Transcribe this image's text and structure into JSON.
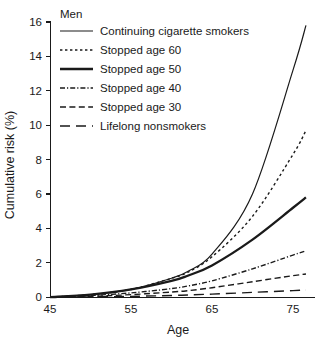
{
  "chart_data": {
    "type": "line",
    "title": "Men",
    "xlabel": "Age",
    "ylabel": "Cumulative risk (%)",
    "xlim": [
      45,
      77
    ],
    "ylim": [
      0,
      16.4
    ],
    "xticks": [
      45,
      55,
      65,
      75
    ],
    "yticks": [
      0,
      2,
      4,
      6,
      8,
      10,
      12,
      14,
      16
    ],
    "xtick_labels": [
      "45",
      "55",
      "65",
      "75"
    ],
    "ytick_labels": [
      "0",
      "2",
      "4",
      "6",
      "8",
      "10",
      "12",
      "14",
      "16"
    ],
    "grid": false,
    "legend_position": "top-left",
    "x": [
      45,
      50,
      55,
      60,
      62,
      65,
      70,
      75,
      76.6
    ],
    "series": [
      {
        "name": "Continuing cigarette smokers",
        "style": "solid-thin",
        "values": [
          0,
          0.15,
          0.45,
          1.1,
          1.5,
          2.5,
          6.0,
          13.2,
          15.8
        ]
      },
      {
        "name": "Stopped age 60",
        "style": "dotted",
        "values": [
          0,
          0.15,
          0.45,
          1.1,
          1.45,
          2.35,
          4.7,
          8.3,
          9.7
        ]
      },
      {
        "name": "Stopped age 50",
        "style": "solid-thick",
        "values": [
          0,
          0.15,
          0.45,
          0.95,
          1.25,
          1.85,
          3.35,
          5.2,
          5.8
        ]
      },
      {
        "name": "Stopped age 40",
        "style": "dash-dot",
        "values": [
          0,
          0.1,
          0.25,
          0.5,
          0.65,
          0.95,
          1.65,
          2.45,
          2.7
        ]
      },
      {
        "name": "Stopped age 30",
        "style": "dashed-short",
        "values": [
          0,
          0.05,
          0.15,
          0.3,
          0.38,
          0.55,
          0.9,
          1.25,
          1.35
        ]
      },
      {
        "name": "Lifelong nonsmokers",
        "style": "dashed-long",
        "values": [
          0,
          0.02,
          0.05,
          0.1,
          0.13,
          0.18,
          0.28,
          0.38,
          0.42
        ]
      }
    ]
  },
  "legend": {
    "title": "Men",
    "entries": [
      {
        "label": "Continuing cigarette smokers",
        "style": "solid-thin"
      },
      {
        "label": "Stopped age 60",
        "style": "dotted"
      },
      {
        "label": "Stopped age 50",
        "style": "solid-thick"
      },
      {
        "label": "Stopped age 40",
        "style": "dash-dot"
      },
      {
        "label": "Stopped age 30",
        "style": "dashed-short"
      },
      {
        "label": "Lifelong nonsmokers",
        "style": "dashed-long"
      }
    ]
  },
  "axes": {
    "y_title": "Cumulative risk (%)",
    "x_title": "Age"
  },
  "colors": {
    "ink": "#1a1a1a",
    "background": "#ffffff"
  }
}
